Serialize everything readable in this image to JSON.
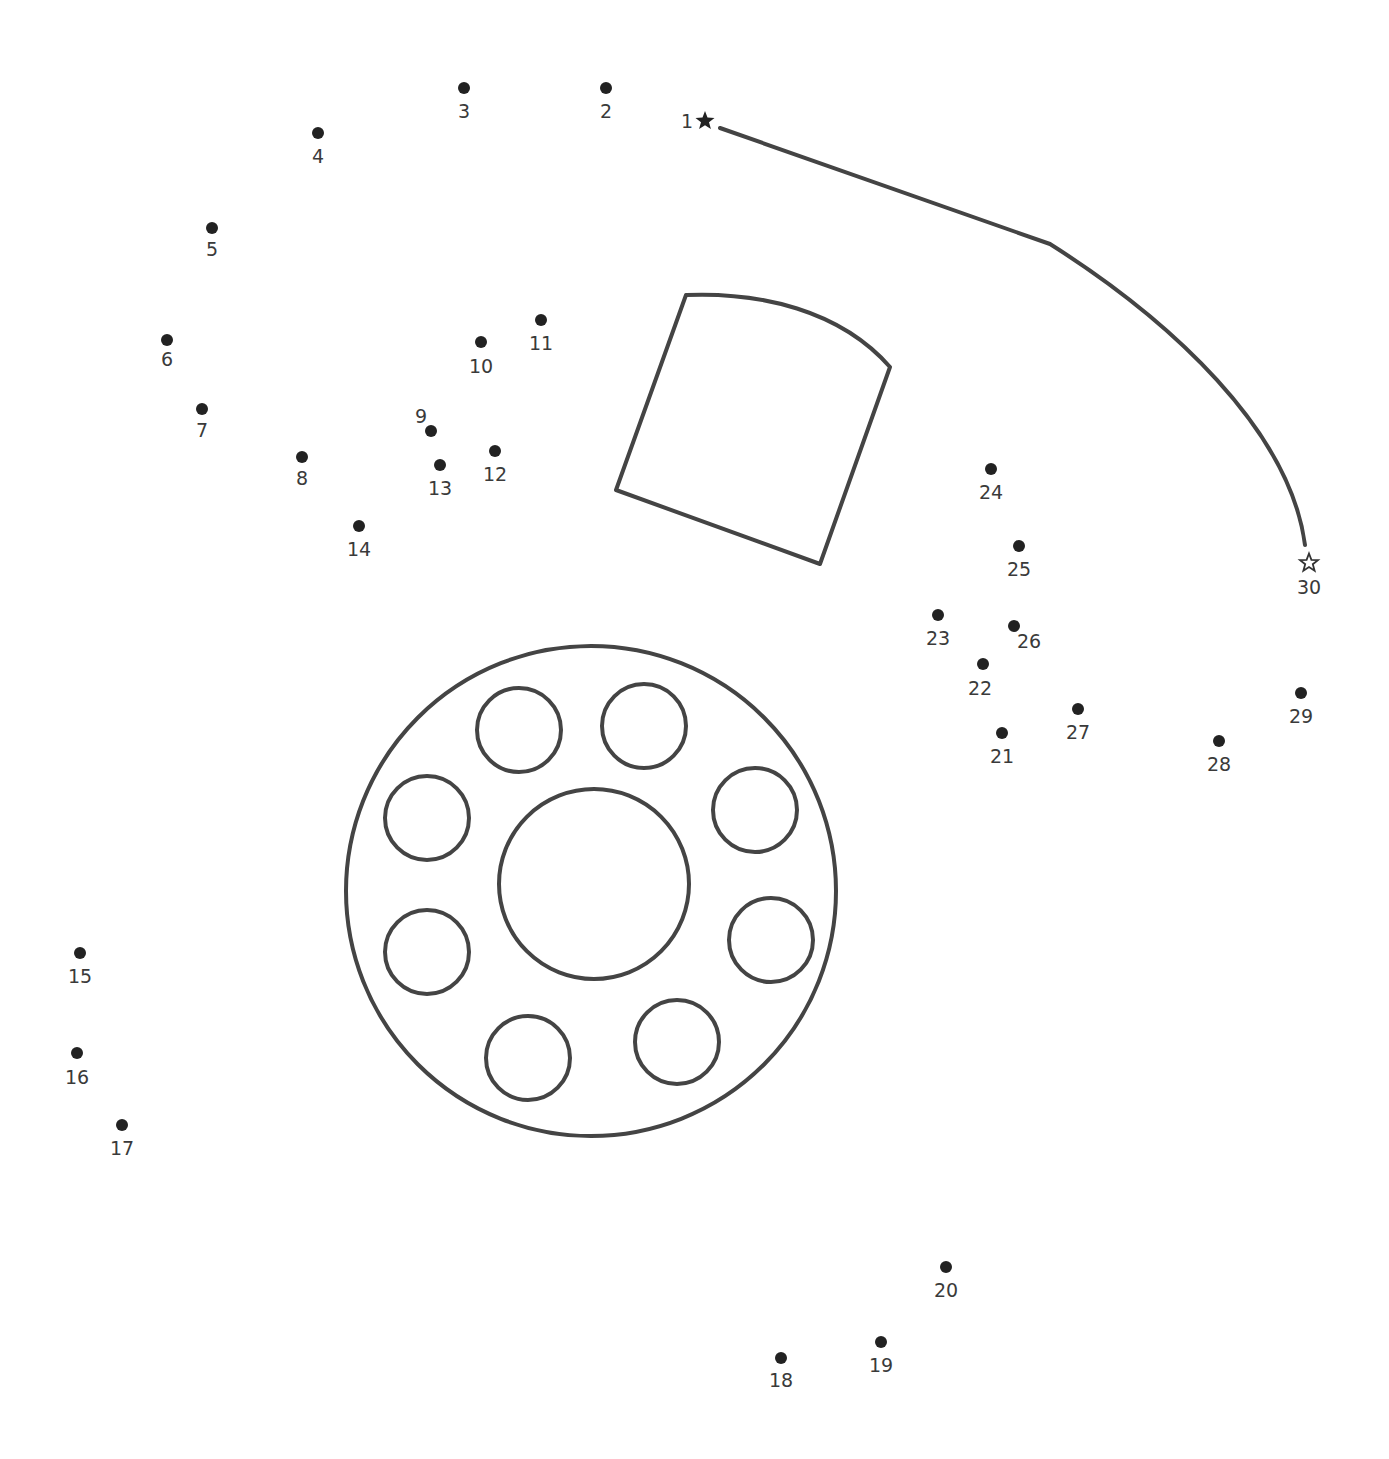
{
  "puzzle": {
    "type": "connect-the-dots",
    "colors": {
      "ink": "#444444",
      "dot": "#222222",
      "label": "#3a3a3a",
      "background": "#ffffff"
    },
    "start_marker": {
      "number": "1",
      "icon": "filled-star-icon",
      "x": 705,
      "y": 121
    },
    "end_marker": {
      "number": "30",
      "icon": "outline-star-icon",
      "x": 1309,
      "y": 563
    },
    "dots": [
      {
        "n": "2",
        "x": 606,
        "y": 88,
        "lx": 606,
        "ly": 118
      },
      {
        "n": "3",
        "x": 464,
        "y": 88,
        "lx": 464,
        "ly": 118
      },
      {
        "n": "4",
        "x": 318,
        "y": 133,
        "lx": 318,
        "ly": 163
      },
      {
        "n": "5",
        "x": 212,
        "y": 228,
        "lx": 212,
        "ly": 256
      },
      {
        "n": "6",
        "x": 167,
        "y": 340,
        "lx": 167,
        "ly": 366
      },
      {
        "n": "7",
        "x": 202,
        "y": 409,
        "lx": 202,
        "ly": 437
      },
      {
        "n": "8",
        "x": 302,
        "y": 457,
        "lx": 302,
        "ly": 485
      },
      {
        "n": "9",
        "x": 431,
        "y": 431,
        "lx": 421,
        "ly": 423
      },
      {
        "n": "10",
        "x": 481,
        "y": 342,
        "lx": 481,
        "ly": 373
      },
      {
        "n": "11",
        "x": 541,
        "y": 320,
        "lx": 541,
        "ly": 350
      },
      {
        "n": "12",
        "x": 495,
        "y": 451,
        "lx": 495,
        "ly": 481
      },
      {
        "n": "13",
        "x": 440,
        "y": 465,
        "lx": 440,
        "ly": 495
      },
      {
        "n": "14",
        "x": 359,
        "y": 526,
        "lx": 359,
        "ly": 556
      },
      {
        "n": "15",
        "x": 80,
        "y": 953,
        "lx": 80,
        "ly": 983
      },
      {
        "n": "16",
        "x": 77,
        "y": 1053,
        "lx": 77,
        "ly": 1084
      },
      {
        "n": "17",
        "x": 122,
        "y": 1125,
        "lx": 122,
        "ly": 1155
      },
      {
        "n": "18",
        "x": 781,
        "y": 1358,
        "lx": 781,
        "ly": 1387
      },
      {
        "n": "19",
        "x": 881,
        "y": 1342,
        "lx": 881,
        "ly": 1372
      },
      {
        "n": "20",
        "x": 946,
        "y": 1267,
        "lx": 946,
        "ly": 1297
      },
      {
        "n": "21",
        "x": 1002,
        "y": 733,
        "lx": 1002,
        "ly": 763
      },
      {
        "n": "22",
        "x": 983,
        "y": 664,
        "lx": 980,
        "ly": 695
      },
      {
        "n": "23",
        "x": 938,
        "y": 615,
        "lx": 938,
        "ly": 645
      },
      {
        "n": "24",
        "x": 991,
        "y": 469,
        "lx": 991,
        "ly": 499
      },
      {
        "n": "25",
        "x": 1019,
        "y": 546,
        "lx": 1019,
        "ly": 576
      },
      {
        "n": "26",
        "x": 1014,
        "y": 626,
        "lx": 1029,
        "ly": 648
      },
      {
        "n": "27",
        "x": 1078,
        "y": 709,
        "lx": 1078,
        "ly": 739
      },
      {
        "n": "28",
        "x": 1219,
        "y": 741,
        "lx": 1219,
        "ly": 771
      },
      {
        "n": "29",
        "x": 1301,
        "y": 693,
        "lx": 1301,
        "ly": 723
      }
    ],
    "drawn_shapes": {
      "guide_line": "M720,128 L1050,244 C1170,320 1290,430 1305,545",
      "tilted_panel": "M686,295 C760,292 840,310 890,367 L820,564 L616,490 Z",
      "outer_circle": {
        "cx": 591,
        "cy": 891,
        "r": 245
      },
      "inner_circle": {
        "cx": 594,
        "cy": 884,
        "r": 95
      },
      "small_circles": [
        {
          "cx": 519,
          "cy": 730,
          "r": 42
        },
        {
          "cx": 644,
          "cy": 726,
          "r": 42
        },
        {
          "cx": 755,
          "cy": 810,
          "r": 42
        },
        {
          "cx": 771,
          "cy": 940,
          "r": 42
        },
        {
          "cx": 677,
          "cy": 1042,
          "r": 42
        },
        {
          "cx": 528,
          "cy": 1058,
          "r": 42
        },
        {
          "cx": 427,
          "cy": 952,
          "r": 42
        },
        {
          "cx": 427,
          "cy": 818,
          "r": 42
        }
      ]
    }
  }
}
